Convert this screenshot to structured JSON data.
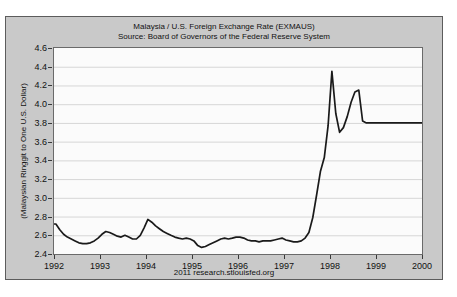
{
  "figure": {
    "footer": "2011 research.stlouisfed.org",
    "colors": {
      "figure_bg": "#c9c9c9",
      "figure_border": "#5c5c5c",
      "plot_bg": "#fbfbfb",
      "plot_border": "#6a6a6a",
      "gridline": "#d6d6d6",
      "line": "#1a1a1a",
      "tick": "#3a3a3a",
      "text": "#111111"
    }
  },
  "chart_data": {
    "type": "line",
    "title": "Malaysia / U.S. Foreign Exchange Rate (EXMAUS)",
    "subtitle": "Source: Board of Governors of the Federal Reserve System",
    "xlabel": "",
    "ylabel": "(Malaysian Ringgit to One U.S. Dollar)",
    "xlim": [
      1992,
      2000
    ],
    "ylim": [
      2.4,
      4.6
    ],
    "x_ticks": [
      1992,
      1993,
      1994,
      1995,
      1996,
      1997,
      1998,
      1999,
      2000
    ],
    "y_ticks": [
      2.4,
      2.6,
      2.8,
      3.0,
      3.2,
      3.4,
      3.6,
      3.8,
      4.0,
      4.2,
      4.4,
      4.6
    ],
    "grid": "horizontal",
    "legend": "none",
    "series": [
      {
        "name": "EXMAUS",
        "frequency": "monthly",
        "start_year": 1992,
        "values": [
          2.72,
          2.66,
          2.61,
          2.58,
          2.56,
          2.54,
          2.52,
          2.51,
          2.51,
          2.52,
          2.54,
          2.57,
          2.61,
          2.64,
          2.63,
          2.61,
          2.59,
          2.58,
          2.6,
          2.58,
          2.56,
          2.56,
          2.6,
          2.68,
          2.77,
          2.74,
          2.7,
          2.67,
          2.64,
          2.62,
          2.6,
          2.58,
          2.57,
          2.56,
          2.57,
          2.56,
          2.54,
          2.49,
          2.47,
          2.48,
          2.5,
          2.52,
          2.54,
          2.56,
          2.57,
          2.56,
          2.57,
          2.58,
          2.58,
          2.57,
          2.55,
          2.54,
          2.54,
          2.53,
          2.54,
          2.54,
          2.54,
          2.55,
          2.56,
          2.57,
          2.55,
          2.54,
          2.53,
          2.53,
          2.54,
          2.57,
          2.63,
          2.79,
          3.03,
          3.28,
          3.43,
          3.77,
          4.35,
          3.9,
          3.7,
          3.75,
          3.87,
          4.02,
          4.13,
          4.15,
          3.82,
          3.8,
          3.8,
          3.8,
          3.8,
          3.8,
          3.8,
          3.8,
          3.8,
          3.8,
          3.8,
          3.8,
          3.8,
          3.8,
          3.8,
          3.8
        ],
        "endpoint": {
          "x": 2000.0,
          "value": 3.8
        }
      }
    ]
  }
}
